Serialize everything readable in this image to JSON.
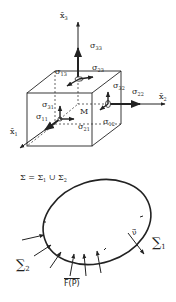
{
  "stress_cube": {
    "axes": {
      "x1": {
        "symbol": "x̄",
        "sub": "1"
      },
      "x2": {
        "symbol": "x̄",
        "sub": "2"
      },
      "x3": {
        "symbol": "x̄",
        "sub": "3"
      }
    },
    "point_label": "M",
    "stresses": [
      {
        "symbol": "σ",
        "sub": "33"
      },
      {
        "symbol": "σ",
        "sub": "23"
      },
      {
        "symbol": "σ",
        "sub": "13"
      },
      {
        "symbol": "σ",
        "sub": "32"
      },
      {
        "symbol": "σ",
        "sub": "22"
      },
      {
        "symbol": "σ",
        "sub": "31"
      },
      {
        "symbol": "σ",
        "sub": "11"
      },
      {
        "symbol": "σ",
        "sub": "21"
      },
      {
        "symbol": "σ",
        "sub": "12"
      }
    ]
  },
  "boundary_body": {
    "equation": {
      "lhs": "Σ = Σ",
      "sub1": "1",
      "op": " ∪ Σ",
      "sub2": "2"
    },
    "normal_label": "ν⃗",
    "sigma1": {
      "symbol": "∑",
      "sub": "1"
    },
    "sigma2": {
      "symbol": "∑",
      "sub": "2"
    },
    "force_label": "F(P)"
  },
  "colors": {
    "ink": "#222222",
    "background": "#ffffff"
  }
}
